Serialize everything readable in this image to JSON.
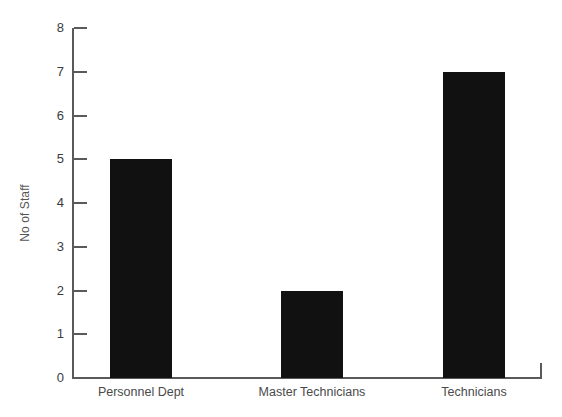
{
  "chart_data": {
    "type": "bar",
    "title": "",
    "xlabel": "",
    "ylabel": "No of Staff",
    "categories": [
      "Personnel Dept",
      "Master Technicians",
      "Technicians"
    ],
    "values": [
      5,
      2,
      7
    ],
    "series": [
      {
        "name": "No of Staff",
        "values": [
          5,
          2,
          7
        ]
      }
    ],
    "ylim": [
      0,
      8
    ],
    "ytick_labels": [
      "0",
      "1",
      "2",
      "3",
      "4",
      "5",
      "6",
      "7",
      "8"
    ],
    "ytick_values": [
      0,
      1,
      2,
      3,
      4,
      5,
      6,
      7,
      8
    ],
    "grid": false,
    "legend": false,
    "legend_position": "none",
    "bar_color": "#111111",
    "axis_color": "#5a5a5a",
    "text_color": "#4a4a4a",
    "background_color": "#ffffff"
  }
}
